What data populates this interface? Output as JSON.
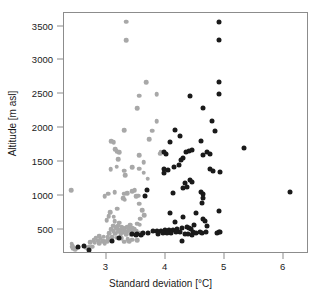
{
  "chart_data": {
    "type": "scatter",
    "title": "",
    "xlabel": "Standard deviation [°C]",
    "ylabel": "Altitude [m asl]",
    "xlim": [
      2.28,
      6.43
    ],
    "ylim": [
      140,
      3700
    ],
    "xticks": [
      3,
      4,
      5,
      6
    ],
    "xtick_labels": [
      "3",
      "4",
      "5",
      "6"
    ],
    "yticks": [
      500,
      1000,
      1500,
      2000,
      2500,
      3000,
      3500
    ],
    "ytick_labels": [
      "500",
      "1000",
      "1500",
      "2000",
      "2500",
      "3000",
      "3500"
    ],
    "grid": false,
    "legend": "none",
    "colors": {
      "series_gray": "#a8a8a8",
      "series_black": "#1a1a1a",
      "frame": "#8c8c8c",
      "background": "#ffffff"
    },
    "series": [
      {
        "name": "gray",
        "color": "#a8a8a8",
        "marker": "circle",
        "points": [
          [
            3.33,
            3570
          ],
          [
            3.33,
            3300
          ],
          [
            3.67,
            2680
          ],
          [
            3.85,
            2500
          ],
          [
            3.55,
            2480
          ],
          [
            3.52,
            2290
          ],
          [
            3.85,
            2100
          ],
          [
            3.3,
            1970
          ],
          [
            3.77,
            1960
          ],
          [
            3.72,
            1840
          ],
          [
            3.08,
            1810
          ],
          [
            3.12,
            1790
          ],
          [
            3.15,
            1690
          ],
          [
            3.17,
            1660
          ],
          [
            3.22,
            1640
          ],
          [
            3.92,
            1640
          ],
          [
            3.91,
            1620
          ],
          [
            3.55,
            1600
          ],
          [
            3.2,
            1540
          ],
          [
            3.63,
            1500
          ],
          [
            3.17,
            1430
          ],
          [
            3.44,
            1420
          ],
          [
            3.55,
            1400
          ],
          [
            3.07,
            1390
          ],
          [
            3.3,
            1370
          ],
          [
            3.63,
            1340
          ],
          [
            3.32,
            1300
          ],
          [
            3.7,
            1250
          ],
          [
            2.4,
            1080
          ],
          [
            3.48,
            1080
          ],
          [
            3.44,
            1070
          ],
          [
            3.14,
            1050
          ],
          [
            3.35,
            1040
          ],
          [
            3.3,
            1030
          ],
          [
            3.03,
            1030
          ],
          [
            3.54,
            1000
          ],
          [
            3.5,
            990
          ],
          [
            2.97,
            990
          ],
          [
            3.28,
            960
          ],
          [
            3.31,
            940
          ],
          [
            3.55,
            880
          ],
          [
            3.18,
            810
          ],
          [
            3.6,
            790
          ],
          [
            3.06,
            760
          ],
          [
            3.64,
            710
          ],
          [
            3.04,
            700
          ],
          [
            3.12,
            690
          ],
          [
            3.57,
            660
          ],
          [
            3.0,
            640
          ],
          [
            3.14,
            625
          ],
          [
            3.22,
            600
          ],
          [
            3.52,
            590
          ],
          [
            3.56,
            575
          ],
          [
            3.4,
            570
          ],
          [
            3.2,
            560
          ],
          [
            3.11,
            555
          ],
          [
            3.26,
            545
          ],
          [
            3.16,
            540
          ],
          [
            3.35,
            535
          ],
          [
            3.4,
            530
          ],
          [
            3.44,
            525
          ],
          [
            3.28,
            520
          ],
          [
            3.18,
            515
          ],
          [
            3.47,
            510
          ],
          [
            3.08,
            505
          ],
          [
            3.23,
            500
          ],
          [
            3.3,
            495
          ],
          [
            3.38,
            490
          ],
          [
            3.45,
            485
          ],
          [
            3.5,
            480
          ],
          [
            3.12,
            475
          ],
          [
            3.2,
            470
          ],
          [
            3.27,
            465
          ],
          [
            3.34,
            460
          ],
          [
            3.41,
            455
          ],
          [
            3.55,
            450
          ],
          [
            3.05,
            445
          ],
          [
            3.15,
            440
          ],
          [
            3.24,
            435
          ],
          [
            3.33,
            430
          ],
          [
            3.42,
            425
          ],
          [
            3.6,
            430
          ],
          [
            2.88,
            400
          ],
          [
            2.95,
            395
          ],
          [
            3.02,
            390
          ],
          [
            3.1,
            385
          ],
          [
            3.18,
            380
          ],
          [
            3.26,
            375
          ],
          [
            2.82,
            370
          ],
          [
            2.9,
            365
          ],
          [
            3.05,
            360
          ],
          [
            3.36,
            355
          ],
          [
            3.44,
            350
          ],
          [
            3.52,
            345
          ],
          [
            2.78,
            340
          ],
          [
            2.86,
            335
          ],
          [
            2.94,
            330
          ],
          [
            3.01,
            325
          ],
          [
            3.3,
            320
          ],
          [
            3.38,
            330
          ],
          [
            2.72,
            310
          ],
          [
            2.8,
            305
          ],
          [
            2.88,
            300
          ],
          [
            2.97,
            295
          ],
          [
            2.41,
            290
          ],
          [
            2.43,
            265
          ],
          [
            2.42,
            250
          ],
          [
            2.44,
            230
          ],
          [
            2.47,
            215
          ],
          [
            2.7,
            250
          ],
          [
            2.76,
            245
          ],
          [
            2.66,
            235
          ]
        ]
      },
      {
        "name": "black",
        "color": "#1a1a1a",
        "marker": "circle",
        "points": [
          [
            4.9,
            3570
          ],
          [
            4.9,
            3300
          ],
          [
            4.9,
            2680
          ],
          [
            4.42,
            2480
          ],
          [
            4.9,
            2500
          ],
          [
            4.63,
            2290
          ],
          [
            4.78,
            2100
          ],
          [
            4.16,
            1970
          ],
          [
            4.84,
            1960
          ],
          [
            4.25,
            1890
          ],
          [
            4.08,
            1800
          ],
          [
            4.6,
            1810
          ],
          [
            5.33,
            1710
          ],
          [
            4.45,
            1680
          ],
          [
            4.4,
            1660
          ],
          [
            4.34,
            1650
          ],
          [
            4.7,
            1640
          ],
          [
            4.75,
            1620
          ],
          [
            3.98,
            1650
          ],
          [
            4.0,
            1620
          ],
          [
            4.64,
            1600
          ],
          [
            4.3,
            1560
          ],
          [
            4.27,
            1530
          ],
          [
            4.23,
            1460
          ],
          [
            4.15,
            1430
          ],
          [
            3.98,
            1390
          ],
          [
            4.05,
            1380
          ],
          [
            4.76,
            1400
          ],
          [
            4.8,
            1360
          ],
          [
            4.92,
            1350
          ],
          [
            3.97,
            1330
          ],
          [
            4.42,
            1230
          ],
          [
            4.45,
            1210
          ],
          [
            4.33,
            1190
          ],
          [
            4.37,
            1130
          ],
          [
            4.3,
            1110
          ],
          [
            4.6,
            1060
          ],
          [
            4.63,
            1030
          ],
          [
            4.12,
            1040
          ],
          [
            6.1,
            1050
          ],
          [
            3.68,
            1080
          ],
          [
            3.65,
            1000
          ],
          [
            4.64,
            960
          ],
          [
            4.62,
            900
          ],
          [
            4.9,
            780
          ],
          [
            4.52,
            740
          ],
          [
            4.08,
            740
          ],
          [
            4.3,
            680
          ],
          [
            4.63,
            660
          ],
          [
            4.66,
            630
          ],
          [
            4.16,
            620
          ],
          [
            4.7,
            560
          ],
          [
            4.48,
            570
          ],
          [
            4.36,
            540
          ],
          [
            4.4,
            530
          ],
          [
            4.43,
            515
          ],
          [
            4.28,
            520
          ],
          [
            4.2,
            510
          ],
          [
            4.13,
            500
          ],
          [
            4.06,
            495
          ],
          [
            3.99,
            490
          ],
          [
            3.92,
            485
          ],
          [
            3.85,
            480
          ],
          [
            3.78,
            475
          ],
          [
            4.9,
            465
          ],
          [
            4.68,
            460
          ],
          [
            4.62,
            455
          ],
          [
            4.58,
            470
          ],
          [
            4.46,
            465
          ],
          [
            4.52,
            455
          ],
          [
            4.25,
            465
          ],
          [
            4.18,
            460
          ],
          [
            4.1,
            455
          ],
          [
            4.02,
            450
          ],
          [
            3.95,
            445
          ],
          [
            3.88,
            440
          ],
          [
            3.7,
            450
          ],
          [
            3.62,
            445
          ],
          [
            3.52,
            440
          ],
          [
            4.88,
            445
          ],
          [
            4.92,
            460
          ],
          [
            4.33,
            440
          ],
          [
            4.38,
            430
          ],
          [
            4.44,
            425
          ],
          [
            3.58,
            420
          ],
          [
            3.5,
            415
          ],
          [
            3.44,
            430
          ],
          [
            3.1,
            330
          ],
          [
            3.22,
            380
          ],
          [
            4.28,
            330
          ],
          [
            2.52,
            250
          ],
          [
            2.7,
            200
          ],
          [
            2.62,
            260
          ]
        ]
      }
    ]
  },
  "axes": {
    "x_title": "Standard deviation [°C]",
    "y_title": "Altitude [m asl]"
  }
}
